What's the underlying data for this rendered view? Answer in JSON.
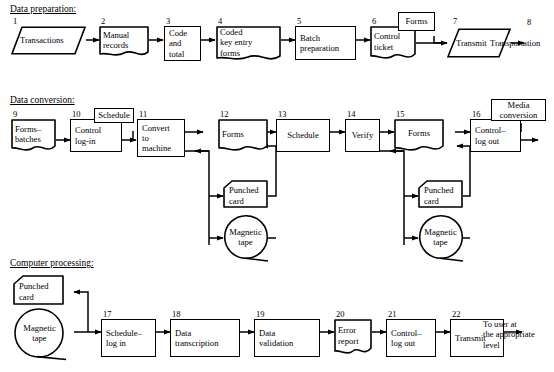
{
  "sections": [
    {
      "id": "sec-data-prep",
      "label": "Data preparation:"
    },
    {
      "id": "sec-data-conv",
      "label": "Data conversion:"
    },
    {
      "id": "sec-comp-proc",
      "label": "Computer processing:"
    }
  ],
  "nodes": [
    {
      "id": "n1",
      "num": "1",
      "label": "Transactions",
      "shape": "parallelogram"
    },
    {
      "id": "n2",
      "num": "2",
      "label": "Manual\nrecords",
      "shape": "document"
    },
    {
      "id": "n3",
      "num": "3",
      "label": "Code\nand\ntotal",
      "shape": "rectangle"
    },
    {
      "id": "n4",
      "num": "4",
      "label": "Coded\nkey entry\nforms",
      "shape": "document"
    },
    {
      "id": "n5",
      "num": "5",
      "label": "Batch\npreparation",
      "shape": "rectangle"
    },
    {
      "id": "n6",
      "num": "6",
      "label": "Control\nticket",
      "shape": "document"
    },
    {
      "id": "n6b",
      "num": "",
      "label": "Forms",
      "shape": "rectangle"
    },
    {
      "id": "n7",
      "num": "7",
      "label": "Transmit",
      "shape": "parallelogram"
    },
    {
      "id": "n9",
      "num": "9",
      "label": "Forms–\nbatches",
      "shape": "document"
    },
    {
      "id": "n10",
      "num": "10",
      "label": "Control\nlog-in",
      "shape": "rectangle"
    },
    {
      "id": "n10b",
      "num": "",
      "label": "Schedule",
      "shape": "rectangle"
    },
    {
      "id": "n11",
      "num": "11",
      "label": "Convert\nto\nmachine",
      "shape": "rectangle"
    },
    {
      "id": "n12",
      "num": "12",
      "label": "Forms",
      "shape": "document"
    },
    {
      "id": "n12c",
      "num": "",
      "label": "Punched\ncard",
      "shape": "punchcard"
    },
    {
      "id": "n12t",
      "num": "",
      "label": "Magnetic\ntape",
      "shape": "tape"
    },
    {
      "id": "n13",
      "num": "13",
      "label": "Schedule",
      "shape": "rectangle"
    },
    {
      "id": "n14",
      "num": "14",
      "label": "Verify",
      "shape": "rectangle"
    },
    {
      "id": "n15",
      "num": "15",
      "label": "Forms",
      "shape": "document"
    },
    {
      "id": "n15c",
      "num": "",
      "label": "Punched\ncard",
      "shape": "punchcard"
    },
    {
      "id": "n15t",
      "num": "",
      "label": "Magnetic\ntape",
      "shape": "tape"
    },
    {
      "id": "n16",
      "num": "16",
      "label": "Control–\nlog out",
      "shape": "rectangle"
    },
    {
      "id": "n16b",
      "num": "",
      "label": "Media\nconversion",
      "shape": "rectangle"
    },
    {
      "id": "np1",
      "num": "",
      "label": "Punched\ncard",
      "shape": "punchcard"
    },
    {
      "id": "nt1",
      "num": "",
      "label": "Magnetic\ntape",
      "shape": "tape"
    },
    {
      "id": "n17",
      "num": "17",
      "label": "Schedule–\nlog in",
      "shape": "rectangle"
    },
    {
      "id": "n18",
      "num": "18",
      "label": "Data\ntranscription",
      "shape": "rectangle"
    },
    {
      "id": "n19",
      "num": "19",
      "label": "Data\nvalidation",
      "shape": "rectangle"
    },
    {
      "id": "n20",
      "num": "20",
      "label": "Error\nreport",
      "shape": "document"
    },
    {
      "id": "n21",
      "num": "21",
      "label": "Control–\nlog out",
      "shape": "rectangle"
    },
    {
      "id": "n22",
      "num": "22",
      "label": "Transmit",
      "shape": "rectangle"
    }
  ],
  "terminators": [
    {
      "id": "t8",
      "num": "8",
      "label": "Transportation"
    },
    {
      "id": "t-user",
      "num": "",
      "label": "To user at\nthe appropriate\nlevel"
    }
  ],
  "style": {
    "stroke": "#000000",
    "background": "#ffffff"
  }
}
